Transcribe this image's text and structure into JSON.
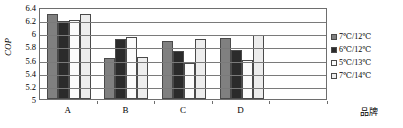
{
  "chart_data": {
    "type": "bar",
    "title": "",
    "xlabel": "品牌",
    "ylabel": "COP",
    "ylim": [
      5,
      6.4
    ],
    "yticks": [
      "6.4",
      "6.2",
      "6",
      "5.8",
      "5.6",
      "5.4",
      "5.2",
      "5"
    ],
    "grid": true,
    "legend_position": "right",
    "categories": [
      "A",
      "B",
      "C",
      "D"
    ],
    "series": [
      {
        "name": "7℃/12℃",
        "color": "#808080",
        "values": [
          6.3,
          5.62,
          5.88,
          5.93
        ]
      },
      {
        "name": "6℃/12℃",
        "color": "#2b2b2b",
        "values": [
          6.18,
          5.91,
          5.73,
          5.75
        ]
      },
      {
        "name": "5℃/13℃",
        "color": "#fbfbfb",
        "values": [
          6.2,
          5.95,
          5.55,
          5.6
        ]
      },
      {
        "name": "7℃/14℃",
        "color": "#ededed",
        "values": [
          6.3,
          5.64,
          5.92,
          5.98
        ]
      }
    ]
  }
}
